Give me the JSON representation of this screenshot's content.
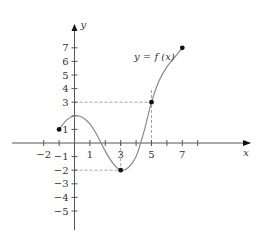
{
  "chart_data": {
    "type": "line",
    "title": "",
    "curve_label": "y = f (x)",
    "xlabel": "x",
    "ylabel": "y",
    "xlim": [
      -3,
      9
    ],
    "ylim": [
      -6,
      8
    ],
    "grid": false,
    "x_tick_values": [
      -2,
      -1,
      0,
      1,
      2,
      3,
      4,
      5,
      6,
      7,
      8
    ],
    "x_tick_labels": [
      {
        "value": -2,
        "label": "−2"
      },
      {
        "value": 1,
        "label": "1"
      },
      {
        "value": 3,
        "label": "3"
      },
      {
        "value": 5,
        "label": "5"
      },
      {
        "value": 7,
        "label": "7"
      }
    ],
    "y_tick_labels": [
      {
        "value": 7,
        "label": "7"
      },
      {
        "value": 6,
        "label": "6"
      },
      {
        "value": 5,
        "label": "5"
      },
      {
        "value": 4,
        "label": "4"
      },
      {
        "value": 3,
        "label": "3"
      },
      {
        "value": 1,
        "label": "1"
      },
      {
        "value": -1,
        "label": "−1"
      },
      {
        "value": -2,
        "label": "−2"
      },
      {
        "value": -3,
        "label": "−3"
      },
      {
        "value": -4,
        "label": "−4"
      },
      {
        "value": -5,
        "label": "−5"
      }
    ],
    "curve_points": [
      {
        "x": -1,
        "y": 1
      },
      {
        "x": -0.5,
        "y": 1.7
      },
      {
        "x": 0,
        "y": 2
      },
      {
        "x": 0.5,
        "y": 1.9
      },
      {
        "x": 1,
        "y": 1.4
      },
      {
        "x": 1.5,
        "y": 0.5
      },
      {
        "x": 2,
        "y": -0.6
      },
      {
        "x": 2.5,
        "y": -1.5
      },
      {
        "x": 3,
        "y": -2
      },
      {
        "x": 3.5,
        "y": -1.8
      },
      {
        "x": 4,
        "y": -1
      },
      {
        "x": 4.5,
        "y": 0.8
      },
      {
        "x": 5,
        "y": 3
      },
      {
        "x": 5.5,
        "y": 4.6
      },
      {
        "x": 6,
        "y": 5.6
      },
      {
        "x": 6.5,
        "y": 6.3
      },
      {
        "x": 7,
        "y": 7
      }
    ],
    "marked_points": [
      {
        "x": -1,
        "y": 1
      },
      {
        "x": 3,
        "y": -2
      },
      {
        "x": 5,
        "y": 3
      },
      {
        "x": 7,
        "y": 7
      }
    ],
    "dashed_guides": [
      {
        "from": [
          0,
          3
        ],
        "to": [
          5,
          3
        ]
      },
      {
        "from": [
          5,
          0
        ],
        "to": [
          5,
          4
        ]
      },
      {
        "from": [
          0,
          -2
        ],
        "to": [
          3,
          -2
        ]
      },
      {
        "from": [
          3,
          0
        ],
        "to": [
          3,
          -2
        ]
      }
    ]
  },
  "colors": {
    "axis": "#555555",
    "curve": "#8a8a8a",
    "dash": "#9a9a9a",
    "point": "#111111",
    "text": "#333333"
  }
}
